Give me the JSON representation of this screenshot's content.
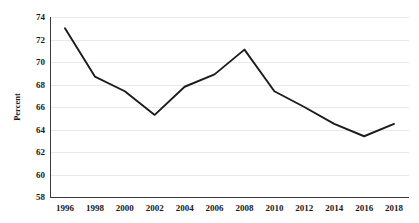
{
  "chart_data": {
    "type": "line",
    "title": "",
    "xlabel": "",
    "ylabel": "Percent",
    "x": [
      1996,
      1998,
      2000,
      2002,
      2004,
      2006,
      2008,
      2010,
      2012,
      2014,
      2016,
      2018
    ],
    "categories": [
      "1996",
      "1998",
      "2000",
      "2002",
      "2004",
      "2006",
      "2008",
      "2010",
      "2012",
      "2014",
      "2016",
      "2018"
    ],
    "values": [
      73.0,
      68.7,
      67.4,
      65.3,
      67.8,
      68.9,
      71.1,
      67.4,
      66.0,
      64.5,
      63.4,
      64.5
    ],
    "series": [
      {
        "name": "Percent",
        "values": [
          73.0,
          68.7,
          67.4,
          65.3,
          67.8,
          68.9,
          71.1,
          67.4,
          66.0,
          64.5,
          63.4,
          64.5
        ],
        "color": "#1c1c1c"
      }
    ],
    "ylim": [
      58,
      74
    ],
    "xlim": [
      1995,
      2019
    ],
    "yticks": [
      58,
      60,
      62,
      64,
      66,
      68,
      70,
      72,
      74
    ],
    "ytick_labels": [
      "58",
      "60",
      "62",
      "64",
      "66",
      "68",
      "70",
      "72",
      "74"
    ],
    "xticks": [
      1996,
      1998,
      2000,
      2002,
      2004,
      2006,
      2008,
      2010,
      2012,
      2014,
      2016,
      2018
    ],
    "xtick_labels": [
      "1996",
      "1998",
      "2000",
      "2002",
      "2004",
      "2006",
      "2008",
      "2010",
      "2012",
      "2014",
      "2016",
      "2018"
    ],
    "grid": "horizontal",
    "legend": "none",
    "markers": "none",
    "line_color": "#1c1c1c",
    "grid_color": "#e9e9ec",
    "axis_color": "#3a3a3a",
    "background": "#ffffff"
  }
}
